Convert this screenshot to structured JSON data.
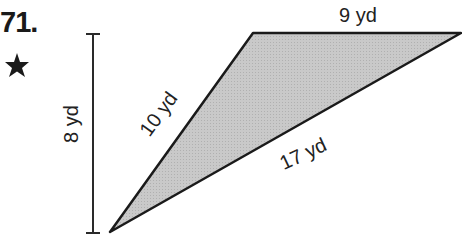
{
  "problem": {
    "number": "71.",
    "marker_icon": "star-icon"
  },
  "figure": {
    "shape": "triangle",
    "fill_color": "#c8c8c8",
    "stroke_color": "#1a1a1a",
    "labels": {
      "top": "9 yd",
      "left_side": "10 yd",
      "bottom_side": "17 yd",
      "height": "8 yd"
    }
  }
}
